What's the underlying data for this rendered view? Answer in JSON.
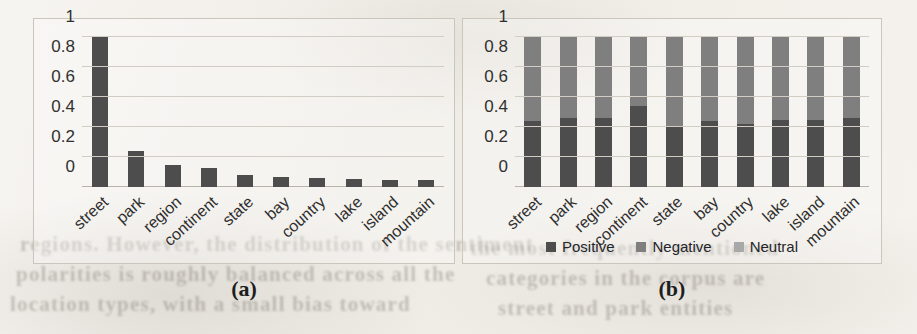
{
  "figure": {
    "panel_a_caption": "(a)",
    "panel_b_caption": "(b)"
  },
  "bleed_through_text": [
    {
      "text": "regions. However, the distribution of the sentiment",
      "x": 20,
      "y": 232,
      "size": 21
    },
    {
      "text": "polarities is roughly balanced across all the",
      "x": 16,
      "y": 262,
      "size": 21
    },
    {
      "text": "location types, with a small bias toward",
      "x": 10,
      "y": 292,
      "size": 21
    },
    {
      "text": "the most frequently mentioned",
      "x": 470,
      "y": 236,
      "size": 21
    },
    {
      "text": "categories in the corpus are",
      "x": 486,
      "y": 266,
      "size": 21
    },
    {
      "text": "street and park entities",
      "x": 498,
      "y": 296,
      "size": 21
    }
  ],
  "chart_data": [
    {
      "type": "bar",
      "panel": "(a)",
      "title": "",
      "xlabel": "",
      "ylabel": "",
      "ylim": [
        0,
        1
      ],
      "yticks": [
        "0",
        "0.2",
        "0.4",
        "0.6",
        "0.8",
        "1"
      ],
      "ytick_values": [
        0,
        0.2,
        0.4,
        0.6,
        0.8,
        1
      ],
      "grid": true,
      "legend": "none",
      "bar_color": "#4d4d4d",
      "categories": [
        "street",
        "park",
        "region",
        "continent",
        "state",
        "bay",
        "country",
        "lake",
        "island",
        "mountain"
      ],
      "values": [
        1.0,
        0.24,
        0.15,
        0.13,
        0.08,
        0.07,
        0.06,
        0.055,
        0.05,
        0.05
      ]
    },
    {
      "type": "bar",
      "subtype": "stacked-100",
      "panel": "(b)",
      "title": "",
      "xlabel": "",
      "ylabel": "",
      "ylim": [
        0,
        1
      ],
      "yticks": [
        "0",
        "0.2",
        "0.4",
        "0.6",
        "0.8",
        "1"
      ],
      "ytick_values": [
        0,
        0.2,
        0.4,
        0.6,
        0.8,
        1
      ],
      "grid": true,
      "legend_position": "bottom",
      "categories": [
        "street",
        "park",
        "region",
        "continent",
        "state",
        "bay",
        "country",
        "lake",
        "island",
        "mountain"
      ],
      "series": [
        {
          "name": "Positive",
          "color": "#4d4d4d",
          "values": [
            0.44,
            0.46,
            0.46,
            0.54,
            0.41,
            0.44,
            0.42,
            0.45,
            0.45,
            0.46
          ]
        },
        {
          "name": "Negative",
          "color": "#7f7f7f",
          "values": [
            0.56,
            0.54,
            0.54,
            0.46,
            0.59,
            0.56,
            0.58,
            0.55,
            0.55,
            0.54
          ]
        },
        {
          "name": "Neutral",
          "color": "#a8a8a8",
          "values": [
            0,
            0,
            0,
            0,
            0,
            0,
            0,
            0,
            0,
            0
          ]
        }
      ]
    }
  ]
}
